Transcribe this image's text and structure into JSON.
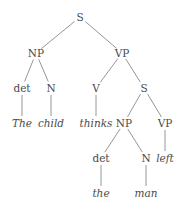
{
  "tree": {
    "line_color": "#8a8a8a",
    "text_color": "#4a4a4a",
    "nodes": [
      {
        "id": "s_root",
        "label": "S",
        "x": 80,
        "y": 17,
        "kind": "category"
      },
      {
        "id": "np1",
        "label": "NP",
        "x": 36,
        "y": 53,
        "kind": "category"
      },
      {
        "id": "vp1",
        "label": "VP",
        "x": 122,
        "y": 53,
        "kind": "category"
      },
      {
        "id": "det1",
        "label": "det",
        "x": 22,
        "y": 88,
        "kind": "category"
      },
      {
        "id": "n1",
        "label": "N",
        "x": 51,
        "y": 88,
        "kind": "category"
      },
      {
        "id": "v1",
        "label": "V",
        "x": 96,
        "y": 88,
        "kind": "category"
      },
      {
        "id": "s2",
        "label": "S",
        "x": 144,
        "y": 88,
        "kind": "category"
      },
      {
        "id": "w_the1",
        "label": "The",
        "x": 22,
        "y": 123,
        "kind": "word"
      },
      {
        "id": "w_child",
        "label": "child",
        "x": 51,
        "y": 123,
        "kind": "word"
      },
      {
        "id": "w_thinks",
        "label": "thinks",
        "x": 96,
        "y": 123,
        "kind": "word"
      },
      {
        "id": "np2",
        "label": "NP",
        "x": 124,
        "y": 123,
        "kind": "category"
      },
      {
        "id": "vp2",
        "label": "VP",
        "x": 165,
        "y": 123,
        "kind": "category"
      },
      {
        "id": "det2",
        "label": "det",
        "x": 101,
        "y": 158,
        "kind": "category"
      },
      {
        "id": "n2",
        "label": "N",
        "x": 146,
        "y": 158,
        "kind": "category"
      },
      {
        "id": "w_left",
        "label": "left",
        "x": 165,
        "y": 158,
        "kind": "word"
      },
      {
        "id": "w_the2",
        "label": "the",
        "x": 101,
        "y": 193,
        "kind": "word"
      },
      {
        "id": "w_man",
        "label": "man",
        "x": 146,
        "y": 193,
        "kind": "word"
      }
    ],
    "edges": [
      [
        "s_root",
        "np1"
      ],
      [
        "s_root",
        "vp1"
      ],
      [
        "np1",
        "det1"
      ],
      [
        "np1",
        "n1"
      ],
      [
        "vp1",
        "v1"
      ],
      [
        "vp1",
        "s2"
      ],
      [
        "det1",
        "w_the1"
      ],
      [
        "n1",
        "w_child"
      ],
      [
        "v1",
        "w_thinks"
      ],
      [
        "s2",
        "np2"
      ],
      [
        "s2",
        "vp2"
      ],
      [
        "np2",
        "det2"
      ],
      [
        "np2",
        "n2"
      ],
      [
        "vp2",
        "w_left"
      ],
      [
        "det2",
        "w_the2"
      ],
      [
        "n2",
        "w_man"
      ]
    ]
  }
}
